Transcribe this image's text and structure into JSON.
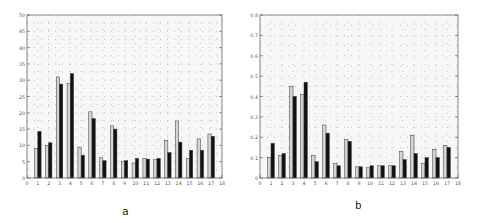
{
  "chart_data": [
    {
      "type": "bar",
      "panel_label": "a",
      "title": "",
      "xlabel": "",
      "ylabel": "",
      "categories": [
        1,
        2,
        3,
        4,
        5,
        6,
        7,
        8,
        9,
        10,
        11,
        12,
        13,
        14,
        15,
        16,
        17
      ],
      "x_ticks": [
        0,
        1,
        2,
        3,
        4,
        5,
        6,
        7,
        8,
        9,
        10,
        11,
        12,
        13,
        14,
        15,
        16,
        17,
        18
      ],
      "xlim": [
        0,
        18
      ],
      "ylim": [
        0,
        50
      ],
      "y_ticks": [
        0,
        5,
        10,
        15,
        20,
        25,
        30,
        35,
        40,
        45,
        50
      ],
      "grid": "dotted",
      "legend": null,
      "series": [
        {
          "name": "series-1",
          "color": "#d4d4d4",
          "values": [
            9,
            10,
            31,
            29,
            9.5,
            20.3,
            6.2,
            16,
            5,
            4.6,
            6,
            5.6,
            11.6,
            17.5,
            6,
            12,
            13.5
          ]
        },
        {
          "name": "series-2",
          "color": "#111111",
          "values": [
            14.3,
            10.8,
            28.8,
            32,
            7,
            18.2,
            5.3,
            15,
            5.3,
            6,
            5.8,
            6,
            7.8,
            11,
            8.5,
            8.5,
            12.8
          ]
        }
      ]
    },
    {
      "type": "bar",
      "panel_label": "b",
      "title": "",
      "xlabel": "",
      "ylabel": "",
      "categories": [
        1,
        2,
        3,
        4,
        5,
        6,
        7,
        8,
        9,
        10,
        11,
        12,
        13,
        14,
        15,
        16,
        17
      ],
      "x_ticks": [
        0,
        1,
        2,
        3,
        4,
        5,
        6,
        7,
        8,
        9,
        10,
        11,
        12,
        13,
        14,
        15,
        16,
        17,
        18
      ],
      "xlim": [
        0,
        18
      ],
      "ylim": [
        0,
        0.8
      ],
      "y_ticks": [
        0,
        0.1,
        0.2,
        0.3,
        0.4,
        0.5,
        0.6,
        0.7,
        0.8
      ],
      "grid": "dotted",
      "legend": null,
      "series": [
        {
          "name": "series-1",
          "color": "#d4d4d4",
          "values": [
            0.1,
            0.11,
            0.45,
            0.41,
            0.11,
            0.26,
            0.07,
            0.19,
            0.055,
            0.05,
            0.06,
            0.06,
            0.13,
            0.21,
            0.07,
            0.14,
            0.16
          ]
        },
        {
          "name": "series-2",
          "color": "#111111",
          "values": [
            0.17,
            0.12,
            0.4,
            0.47,
            0.08,
            0.22,
            0.06,
            0.18,
            0.055,
            0.06,
            0.06,
            0.06,
            0.09,
            0.12,
            0.1,
            0.1,
            0.15
          ]
        }
      ]
    }
  ],
  "captions": {
    "a": "a",
    "b": "b"
  }
}
